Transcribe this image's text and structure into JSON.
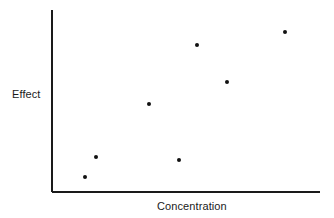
{
  "chart_data": {
    "type": "scatter",
    "title": "",
    "xlabel": "Concentration",
    "ylabel": "Effect",
    "grid": false,
    "legend": null,
    "axis_style": "open-L",
    "ticks": {
      "x": [],
      "y": []
    },
    "xlim": [
      0,
      100
    ],
    "ylim": [
      0,
      100
    ],
    "marker": {
      "shape": "circle",
      "color": "#111111",
      "size_px": 4
    },
    "axis_color": "#1a1a1a",
    "background": "#ffffff",
    "points": [
      {
        "x": 12.3,
        "y": 8.2
      },
      {
        "x": 16.4,
        "y": 19.2
      },
      {
        "x": 36.2,
        "y": 48.4
      },
      {
        "x": 47.4,
        "y": 17.6
      },
      {
        "x": 54.1,
        "y": 80.8
      },
      {
        "x": 65.3,
        "y": 60.4
      },
      {
        "x": 86.9,
        "y": 87.9
      }
    ],
    "pixel_points": [
      {
        "cx": 85,
        "cy": 177
      },
      {
        "cx": 96,
        "cy": 157
      },
      {
        "cx": 149,
        "cy": 104
      },
      {
        "cx": 179,
        "cy": 160
      },
      {
        "cx": 197,
        "cy": 45
      },
      {
        "cx": 227,
        "cy": 82
      },
      {
        "cx": 285,
        "cy": 32
      }
    ],
    "axes_geometry": {
      "origin_x": 52,
      "origin_y": 192,
      "y_axis_top": 10,
      "x_axis_right": 320,
      "line_width": 1.6
    }
  }
}
